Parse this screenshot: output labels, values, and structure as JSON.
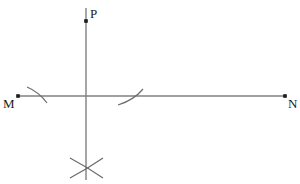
{
  "figure": {
    "background_color": "#ffffff",
    "line_color": "#808080",
    "arc_color": "#6b6b6b",
    "point_color": "#1a1a1a",
    "label_color": "#1a1a1a",
    "width": 300,
    "height": 184
  },
  "labels": {
    "m": "M",
    "n": "N",
    "p": "P"
  },
  "points": [
    {
      "name": "M",
      "x": 18,
      "y": 96
    },
    {
      "name": "N",
      "x": 285,
      "y": 96
    },
    {
      "name": "P",
      "x": 86,
      "y": 21
    }
  ],
  "lines": [
    {
      "name": "line-MN",
      "x1": 18,
      "y1": 96,
      "x2": 285,
      "y2": 96
    },
    {
      "name": "line-vertical",
      "x1": 86,
      "y1": 8,
      "x2": 86,
      "y2": 180
    }
  ],
  "arcs": [
    {
      "name": "arc-left",
      "d": "M 27 87 Q 39 92 47 103"
    },
    {
      "name": "arc-right",
      "d": "M 118 105 Q 134 100 143 89"
    },
    {
      "name": "arc-bottom-down",
      "d": "M 70 158 Q 87 167 103 178"
    },
    {
      "name": "arc-bottom-up",
      "d": "M 70 178 Q 87 169 103 158"
    }
  ]
}
